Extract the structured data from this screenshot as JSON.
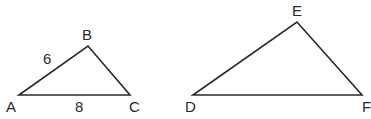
{
  "figure": {
    "triangles": [
      {
        "name": "ABC",
        "vertices": {
          "a": "A",
          "b": "B",
          "c": "C"
        },
        "side_labels": {
          "ab": "6",
          "ac": "8"
        }
      },
      {
        "name": "DEF",
        "vertices": {
          "d": "D",
          "e": "E",
          "f": "F"
        },
        "side_labels": {}
      }
    ]
  }
}
